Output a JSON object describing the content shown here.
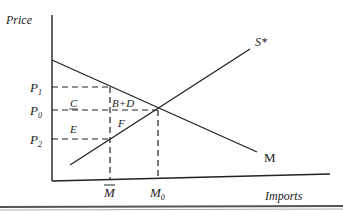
{
  "diagram": {
    "type": "economics-import-quota",
    "axes": {
      "y_label": "Price",
      "x_label": "Imports"
    },
    "curves": {
      "supply": {
        "label": "S*",
        "from": [
          70,
          165
        ],
        "to": [
          250,
          49
        ]
      },
      "demand": {
        "label": "M",
        "from": [
          52,
          60
        ],
        "to": [
          257,
          152
        ]
      }
    },
    "price_levels": [
      {
        "id": "P1",
        "label": "P",
        "sub": "1",
        "y": 87
      },
      {
        "id": "P0",
        "label": "P",
        "sub": "0",
        "y": 110
      },
      {
        "id": "P2",
        "label": "P",
        "sub": "2",
        "y": 139
      }
    ],
    "quantity_levels": [
      {
        "id": "Mbar",
        "label": "M",
        "overbar": true,
        "x": 110
      },
      {
        "id": "M0",
        "label": "M",
        "sub": "0",
        "x": 158
      }
    ],
    "regions": [
      {
        "label": "C",
        "x": 72,
        "y": 106
      },
      {
        "label": "B+D",
        "x": 112,
        "y": 106
      },
      {
        "label": "E",
        "x": 72,
        "y": 131
      },
      {
        "label": "F",
        "x": 117,
        "y": 125
      }
    ],
    "equilibrium": {
      "x": 158,
      "y": 110
    }
  }
}
